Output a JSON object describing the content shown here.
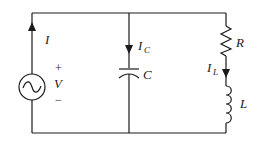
{
  "diagram": {
    "type": "parallel RLC circuit",
    "source": {
      "label": "V",
      "plus": "+",
      "minus": "−",
      "current_label": "I",
      "symbol": "ac-source-icon"
    },
    "capacitor_branch": {
      "label": "C",
      "current_main": "I",
      "current_sub": "C"
    },
    "rl_branch": {
      "resistor_label": "R",
      "inductor_label": "L",
      "current_main": "I",
      "current_sub": "L"
    },
    "colors": {
      "line": "#1a1a1a",
      "background": "#ffffff"
    }
  }
}
